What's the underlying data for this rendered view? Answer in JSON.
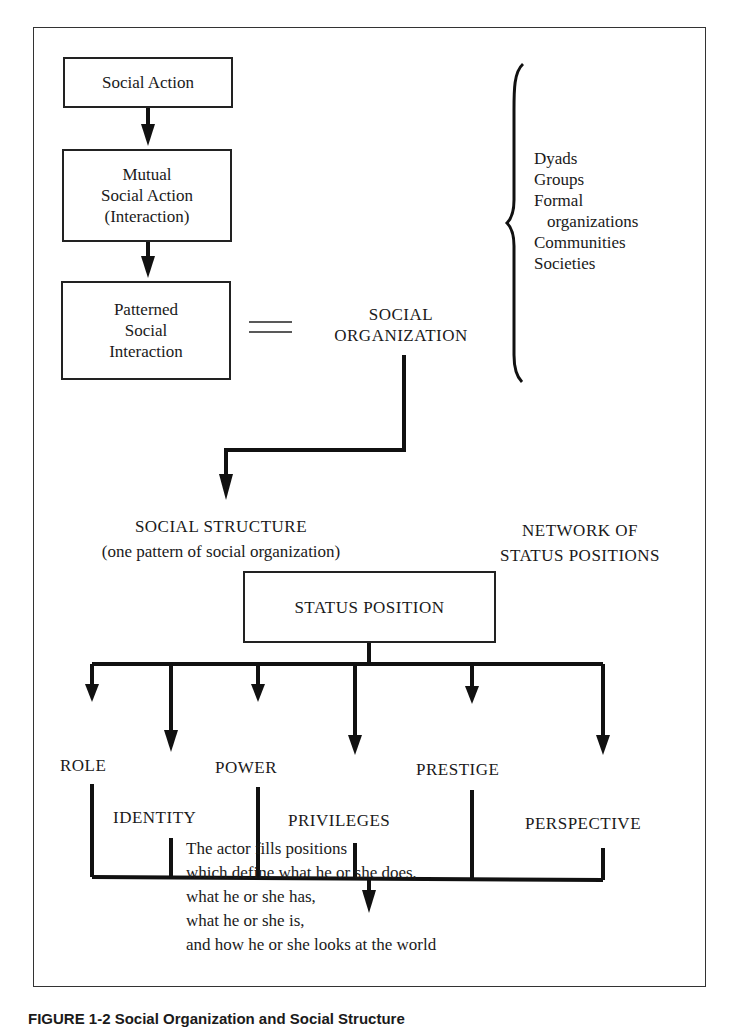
{
  "flow": {
    "social_action": "Social Action",
    "mutual_social_action": [
      "Mutual",
      "Social Action",
      "(Interaction)"
    ],
    "patterned_social_interaction": [
      "Patterned",
      "Social",
      "Interaction"
    ],
    "social_organization": [
      "SOCIAL",
      "ORGANIZATION"
    ],
    "equals_symbol": "="
  },
  "organization_types": [
    "Dyads",
    "Groups",
    "Formal",
    "organizations",
    "Communities",
    "Societies"
  ],
  "structure": {
    "social_structure": "SOCIAL STRUCTURE",
    "social_structure_note": "(one pattern of social organization)",
    "network": [
      "NETWORK OF",
      "STATUS POSITIONS"
    ],
    "status_position": "STATUS POSITION"
  },
  "components": [
    "ROLE",
    "IDENTITY",
    "POWER",
    "PRIVILEGES",
    "PRESTIGE",
    "PERSPECTIVE"
  ],
  "conclusion": [
    "The actor fills positions",
    "which define what he or she does,",
    "what he or she has,",
    "what he or she is,",
    "and how he or she looks at the world"
  ],
  "caption": "FIGURE 1-2   Social Organization and Social Structure"
}
